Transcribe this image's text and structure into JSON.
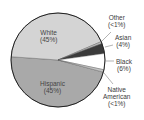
{
  "chart_data": {
    "type": "pie",
    "title": "",
    "categories": [
      "White",
      "Hispanic",
      "Black",
      "Asian",
      "Native American",
      "Other"
    ],
    "values": [
      45,
      45,
      6,
      4,
      0.5,
      0.5
    ],
    "labels": {
      "White": "(45%)",
      "Hispanic": "(45%)",
      "Black": "(6%)",
      "Asian": "(4%)",
      "Native American": "(<1%)",
      "Other": "(<1%)"
    },
    "colors": {
      "White": "#d4d4d4",
      "Hispanic": "#a9a9a9",
      "Black": "#ffffff",
      "Asian": "#3b3b3b",
      "Native American": "#c8c8c8",
      "Other": "#bdbdbd"
    },
    "legend": "callout labels"
  },
  "labels": {
    "white": {
      "name": "White",
      "pct": "(45%)"
    },
    "hispanic": {
      "name": "Hispanic",
      "pct": "(45%)"
    },
    "black": {
      "name": "Black",
      "pct": "(6%)"
    },
    "asian": {
      "name": "Asian",
      "pct": "(4%)"
    },
    "native": {
      "name1": "Native",
      "name2": "American",
      "pct": "(<1%)"
    },
    "other": {
      "name": "Other",
      "pct": "(<1%)"
    }
  }
}
